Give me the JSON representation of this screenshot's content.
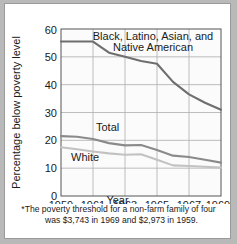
{
  "chart_data": {
    "type": "line",
    "title": "",
    "xlabel": "Year",
    "ylabel": "Percentage below poverty level",
    "x": [
      1959,
      1960,
      1961,
      1962,
      1963,
      1964,
      1965,
      1966,
      1967,
      1968,
      1969
    ],
    "xlim": [
      1959,
      1969
    ],
    "ylim": [
      0,
      60
    ],
    "ytick_labels": [
      "0",
      "10",
      "20",
      "30",
      "40",
      "50",
      "60"
    ],
    "yticks": [
      0,
      10,
      20,
      30,
      40,
      50,
      60
    ],
    "xtick_labels": [
      "1959",
      "1961",
      "1963",
      "1965",
      "1967",
      "1969"
    ],
    "xticks": [
      1959,
      1961,
      1963,
      1965,
      1967,
      1969
    ],
    "grid": true,
    "legend_position": "inline-labels",
    "series": [
      {
        "name": "Black, Latino, Asian, and Native American",
        "label_line_1": "Black, Latino, Asian, and",
        "label_line_2": "Native American",
        "color": "#6e6e6e",
        "values": [
          55.5,
          55.5,
          55.5,
          51.5,
          50.0,
          48.5,
          47.5,
          41.0,
          36.5,
          33.5,
          31.0
        ]
      },
      {
        "name": "Total",
        "label_line_1": "Total",
        "color": "#8a8a8a",
        "values": [
          21.5,
          21.3,
          20.5,
          19.0,
          18.2,
          18.3,
          16.5,
          14.5,
          14.0,
          13.0,
          12.0
        ]
      },
      {
        "name": "White",
        "label_line_1": "White",
        "color": "#c2c2c2",
        "values": [
          17.5,
          16.8,
          16.0,
          15.3,
          14.8,
          15.0,
          13.0,
          11.0,
          10.8,
          10.5,
          10.2
        ]
      }
    ],
    "footnote": {
      "line_1": "*The poverty threshold for a non-farm family of four",
      "line_2": "was  $3,743 in 1969 and $2,973 in 1959."
    }
  }
}
